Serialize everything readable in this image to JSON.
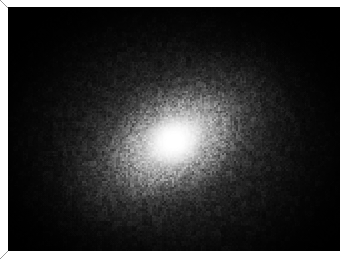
{
  "plate": {
    "width": 346,
    "height": 261,
    "background_color": "#ffffff",
    "caption": ""
  },
  "crop_marks": {
    "stroke_color": "#9a9a9a",
    "positions": [
      "top-left",
      "bottom-left"
    ]
  },
  "image": {
    "name": "astronomical-grayscale-image",
    "description": "Grayscale astronomical observation showing a bright unresolved central source surrounded by a diffuse, slightly elongated halo fading into a noisy black background.",
    "colormap": "grayscale",
    "frame": {
      "x": 8,
      "y": 7,
      "width": 332,
      "height": 244
    },
    "background_color": "#000000",
    "peak_color": "#ffffff",
    "core": {
      "center_x_pct": 50,
      "center_y_pct": 55,
      "peak_intensity": 255
    },
    "halo": {
      "position_angle_deg": -30,
      "axis_ratio": 0.7
    },
    "noise": {
      "type": "pixelated-mottle",
      "grain_px": 3
    }
  },
  "chart_data": {
    "type": "heatmap",
    "title": "",
    "xlabel": "",
    "ylabel": "",
    "colormap": "grayscale",
    "legend_position": "none",
    "grid": false,
    "vmin": 0,
    "vmax": 255,
    "center": {
      "x": 0.5,
      "y": 0.55
    },
    "profile_note": "Radial surface-brightness profile: steeply peaked nucleus falling to black background.",
    "radial_profile": {
      "radius_px": [
        0,
        8,
        16,
        24,
        34,
        46,
        60,
        78,
        96,
        118,
        142,
        170
      ],
      "intensity": [
        255,
        243,
        214,
        178,
        142,
        112,
        86,
        62,
        43,
        27,
        14,
        5
      ]
    }
  }
}
